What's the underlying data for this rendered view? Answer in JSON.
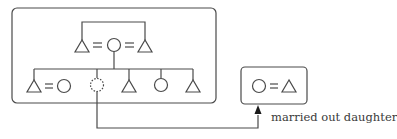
{
  "diagram": {
    "type": "kinship-chart",
    "colors": {
      "stroke": "#4a4a4a",
      "background": "#ffffff"
    },
    "symbols": {
      "male": "triangle",
      "female": "circle",
      "married": "=",
      "moved_out": "dashed-circle"
    },
    "household_box": {
      "parents_row": [
        "male",
        "=",
        "female",
        "=",
        "male"
      ],
      "children_row": [
        "male",
        "=",
        "female",
        "dashed-female",
        "male",
        "female",
        "male"
      ]
    },
    "married_out_box": {
      "couple": [
        "female",
        "=",
        "male"
      ]
    },
    "caption": "married out daughter"
  }
}
